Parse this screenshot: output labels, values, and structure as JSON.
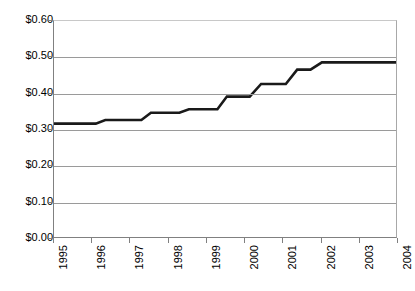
{
  "chart_data": {
    "type": "line",
    "title": "",
    "xlabel": "",
    "ylabel": "",
    "x": [
      1995,
      1996,
      1997,
      1998,
      1999,
      2000,
      2001,
      2002,
      2003,
      2004
    ],
    "categories": [
      "1995",
      "1996",
      "1997",
      "1998",
      "1999",
      "2000",
      "2001",
      "2002",
      "2003",
      "2004"
    ],
    "values": [
      0.315,
      0.315,
      0.325,
      0.345,
      0.355,
      0.39,
      0.425,
      0.465,
      0.485,
      0.485
    ],
    "series": [
      {
        "name": "Price",
        "values": [
          0.315,
          0.315,
          0.325,
          0.345,
          0.355,
          0.39,
          0.425,
          0.465,
          0.485,
          0.485
        ]
      }
    ],
    "step_points": [
      {
        "x": 1995.0,
        "y": 0.315
      },
      {
        "x": 1996.1,
        "y": 0.315
      },
      {
        "x": 1996.35,
        "y": 0.325
      },
      {
        "x": 1997.3,
        "y": 0.325
      },
      {
        "x": 1997.55,
        "y": 0.345
      },
      {
        "x": 1998.3,
        "y": 0.345
      },
      {
        "x": 1998.55,
        "y": 0.355
      },
      {
        "x": 1999.3,
        "y": 0.355
      },
      {
        "x": 1999.55,
        "y": 0.39
      },
      {
        "x": 2000.15,
        "y": 0.39
      },
      {
        "x": 2000.45,
        "y": 0.425
      },
      {
        "x": 2001.1,
        "y": 0.425
      },
      {
        "x": 2001.4,
        "y": 0.465
      },
      {
        "x": 2001.75,
        "y": 0.465
      },
      {
        "x": 2002.05,
        "y": 0.485
      },
      {
        "x": 2004.0,
        "y": 0.485
      }
    ],
    "ylim": [
      0.0,
      0.6
    ],
    "xlim": [
      1995,
      2004
    ],
    "ytick_values": [
      0.0,
      0.1,
      0.2,
      0.3,
      0.4,
      0.5,
      0.6
    ],
    "ytick_labels": [
      "$0.00",
      "$0.10",
      "$0.20",
      "$0.30",
      "$0.40",
      "$0.50",
      "$0.60"
    ],
    "grid": "horizontal",
    "legend": "none",
    "line_color": "#1a1a1a",
    "line_width": 2.6,
    "gridline_color": "#9a9a9a",
    "axis_color": "#808080",
    "background": "#ffffff",
    "xtick_label_rotation": -90
  }
}
